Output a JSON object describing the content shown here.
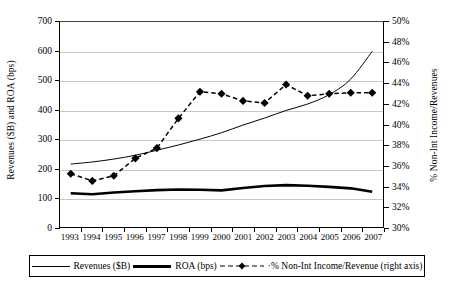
{
  "chart_data": {
    "type": "line",
    "title": "",
    "categories": [
      "1993",
      "1994",
      "1995",
      "1996",
      "1997",
      "1998",
      "1999",
      "2000",
      "2001",
      "2002",
      "2003",
      "2004",
      "2005",
      "2006",
      "2007"
    ],
    "ylabel": "Revenues ($B) and ROA (bps)",
    "ylabel_right": "% Non-Int Income/Revenues",
    "xlabel": "",
    "ylim": [
      0,
      700
    ],
    "ylim_right": [
      30,
      50
    ],
    "ytick_labels": [
      "700",
      "600",
      "500",
      "400",
      "300",
      "200",
      "100",
      "0"
    ],
    "ytick_values": [
      700,
      600,
      500,
      400,
      300,
      200,
      100,
      0
    ],
    "ytick_labels_right": [
      "50%",
      "48%",
      "46%",
      "44%",
      "42%",
      "40%",
      "38%",
      "36%",
      "34%",
      "32%",
      "30%"
    ],
    "ytick_values_right": [
      50,
      48,
      46,
      44,
      42,
      40,
      38,
      36,
      34,
      32,
      30
    ],
    "grid": true,
    "legend_position": "bottom",
    "series": [
      {
        "name": "Revenues ($B)",
        "axis": "left",
        "style": "thin-line",
        "values": [
          215,
          222,
          232,
          245,
          262,
          280,
          300,
          322,
          348,
          372,
          398,
          420,
          452,
          505,
          600
        ]
      },
      {
        "name": "ROA (bps)",
        "axis": "left",
        "style": "thick-line",
        "values": [
          115,
          112,
          118,
          122,
          126,
          128,
          127,
          125,
          133,
          140,
          143,
          141,
          137,
          132,
          120
        ]
      },
      {
        "name": "% Non-Int Income/Revenue (right axis)",
        "axis": "right",
        "style": "dashed-diamond",
        "values": [
          35.2,
          34.5,
          35.0,
          36.7,
          37.7,
          40.6,
          43.2,
          43.0,
          42.3,
          42.1,
          43.9,
          42.8,
          43.0,
          43.1,
          43.1
        ]
      }
    ]
  },
  "legend": {
    "entries": [
      {
        "label": "Revenues ($B)"
      },
      {
        "label": "ROA (bps)"
      },
      {
        "label": "·% Non-Int Income/Revenue (right axis)"
      }
    ]
  }
}
